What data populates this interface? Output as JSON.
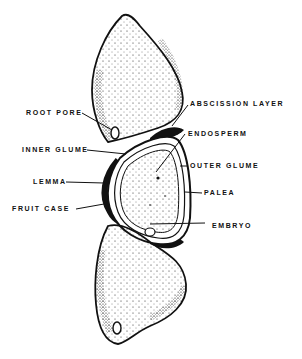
{
  "figure": {
    "type": "anatomical line drawing",
    "labels": {
      "left": [
        {
          "id": "root_pore",
          "text": "ROOT PORE",
          "x": 26,
          "y": 110
        },
        {
          "id": "inner_glume",
          "text": "INNER GLUME",
          "x": 22,
          "y": 147
        },
        {
          "id": "lemma",
          "text": "LEMMA",
          "x": 33,
          "y": 179
        },
        {
          "id": "fruit_case",
          "text": "FRUIT CASE",
          "x": 12,
          "y": 206
        }
      ],
      "right": [
        {
          "id": "abscission_layer",
          "text": "ABSCISSION LAYER",
          "x": 190,
          "y": 101
        },
        {
          "id": "endosperm",
          "text": "ENDOSPERM",
          "x": 188,
          "y": 131
        },
        {
          "id": "outer_glume",
          "text": "OUTER GLUME",
          "x": 190,
          "y": 163
        },
        {
          "id": "palea",
          "text": "PALEA",
          "x": 204,
          "y": 190
        },
        {
          "id": "embryo",
          "text": "EMBRYO",
          "x": 212,
          "y": 224
        }
      ]
    },
    "colors": {
      "ink": "#111111",
      "background": "#ffffff"
    }
  }
}
